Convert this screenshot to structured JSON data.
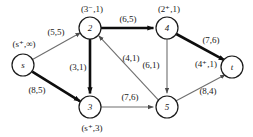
{
  "diagram": {
    "type": "flow-network",
    "title": "",
    "nodes": [
      {
        "id": "s",
        "label": "s",
        "x": 23,
        "y": 65,
        "r": 11,
        "state_label": "(s⁺,∞)",
        "state_x": 24,
        "state_y": 44
      },
      {
        "id": "2",
        "label": "2",
        "x": 90,
        "y": 28,
        "r": 11,
        "state_label": "(3⁻,1)",
        "state_x": 92,
        "state_y": 9
      },
      {
        "id": "3",
        "label": "3",
        "x": 90,
        "y": 107,
        "r": 11,
        "state_label": "(s⁺,3)",
        "state_x": 92,
        "state_y": 128
      },
      {
        "id": "4",
        "label": "4",
        "x": 167,
        "y": 28,
        "r": 11,
        "state_label": "(2⁺,1)",
        "state_x": 169,
        "state_y": 9
      },
      {
        "id": "5",
        "label": "5",
        "x": 167,
        "y": 107,
        "r": 11,
        "state_label": "",
        "state_x": 0,
        "state_y": 0
      },
      {
        "id": "t",
        "label": "t",
        "x": 232,
        "y": 67,
        "r": 11,
        "state_label": "(4⁺,1)",
        "state_x": 206,
        "state_y": 64
      }
    ],
    "edges": [
      {
        "from": "s",
        "to": "2",
        "label": "(5,5)",
        "lx": 56,
        "ly": 32,
        "thick": false,
        "capacity": 5,
        "flow": 5
      },
      {
        "from": "s",
        "to": "3",
        "label": "(8,5)",
        "lx": 37,
        "ly": 90,
        "thick": true,
        "capacity": 8,
        "flow": 5
      },
      {
        "from": "2",
        "to": "4",
        "label": "(6,5)",
        "lx": 128,
        "ly": 19,
        "thick": true,
        "capacity": 6,
        "flow": 5
      },
      {
        "from": "2",
        "to": "3",
        "label": "(3,1)",
        "lx": 78,
        "ly": 67,
        "thick": true,
        "capacity": 3,
        "flow": 1
      },
      {
        "from": "5",
        "to": "2",
        "label": "(4,1)",
        "lx": 131,
        "ly": 58,
        "thick": false,
        "capacity": 4,
        "flow": 1
      },
      {
        "from": "4",
        "to": "5",
        "label": "(6,1)",
        "lx": 151,
        "ly": 65,
        "thick": false,
        "capacity": 6,
        "flow": 1
      },
      {
        "from": "4",
        "to": "t",
        "label": "(7,6)",
        "lx": 211,
        "ly": 40,
        "thick": true,
        "capacity": 7,
        "flow": 6
      },
      {
        "from": "3",
        "to": "5",
        "label": "(7,6)",
        "lx": 130,
        "ly": 97,
        "thick": false,
        "capacity": 7,
        "flow": 6
      },
      {
        "from": "5",
        "to": "t",
        "label": "(8,4)",
        "lx": 208,
        "ly": 91,
        "thick": false,
        "capacity": 8,
        "flow": 4
      }
    ],
    "colors": {
      "stroke_thick": "#0d0d0d",
      "stroke_thin": "#6e6e6e",
      "node_stroke": "#1a1a1a",
      "text": "#1a1a1a",
      "background": "#ffffff"
    }
  }
}
